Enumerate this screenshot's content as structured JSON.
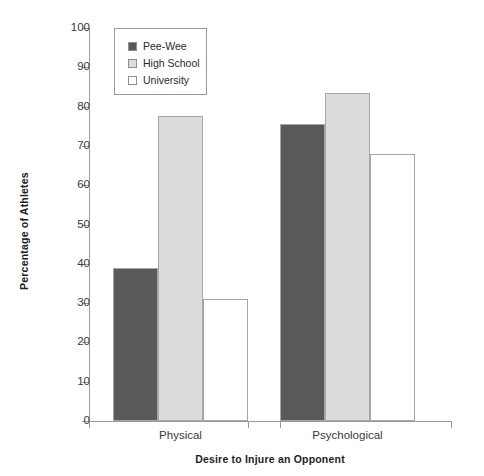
{
  "chart_data": {
    "type": "bar",
    "title": "",
    "xlabel": "Desire to Injure an Opponent",
    "ylabel": "Percentage of Athletes",
    "categories": [
      "Physical",
      "Psychological"
    ],
    "series": [
      {
        "name": "Pee-Wee",
        "values": [
          39,
          75.5
        ],
        "color": "#595959"
      },
      {
        "name": "High School",
        "values": [
          77.5,
          83.5
        ],
        "color": "#dcdcdc"
      },
      {
        "name": "University",
        "values": [
          31,
          68
        ],
        "color": "#ffffff"
      }
    ],
    "ylim": [
      0,
      100
    ],
    "ytick_labels": [
      "0",
      "10",
      "20",
      "30",
      "40",
      "50",
      "60",
      "70",
      "80",
      "90",
      "100"
    ],
    "ytick_values": [
      0,
      10,
      20,
      30,
      40,
      50,
      60,
      70,
      80,
      90,
      100
    ],
    "grid": false,
    "legend_position": "top-left",
    "legend_entries": [
      "Pee-Wee",
      "High School",
      "University"
    ]
  },
  "legend": {
    "items": [
      {
        "label": "Pee-Wee"
      },
      {
        "label": "High School"
      },
      {
        "label": "University"
      }
    ]
  },
  "axes": {
    "y_title": "Percentage of Athletes",
    "x_title": "Desire to Injure an Opponent"
  }
}
